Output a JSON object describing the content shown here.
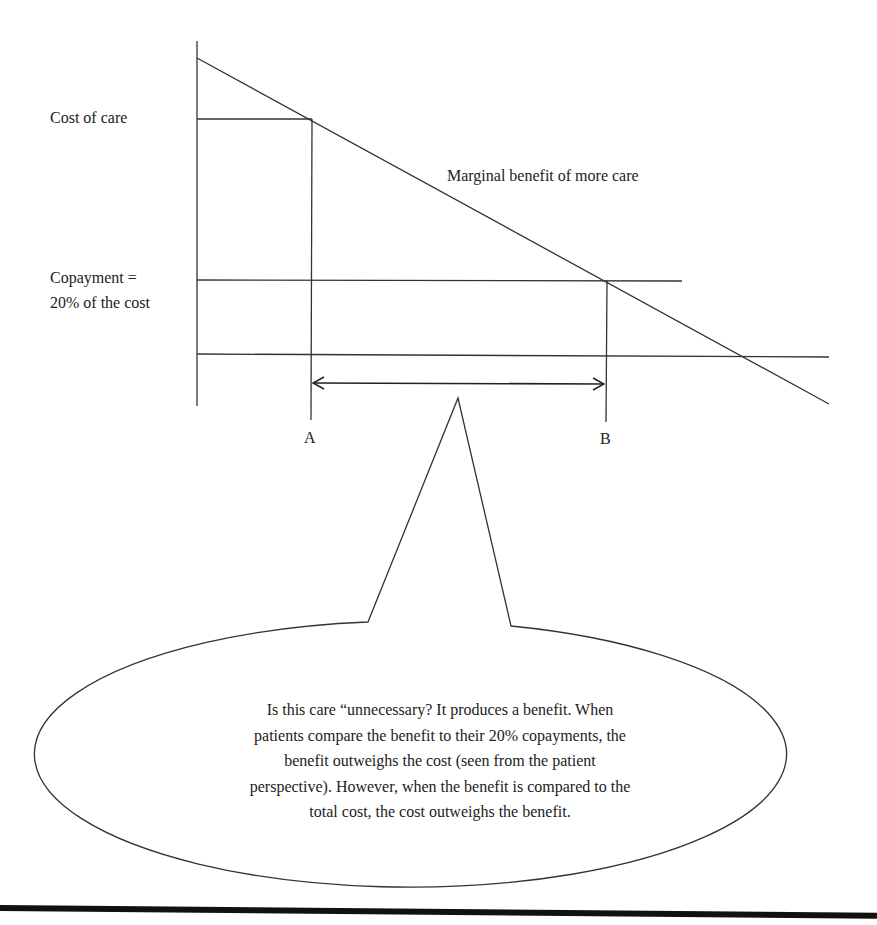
{
  "diagram": {
    "type": "economics-marginal-benefit",
    "labels": {
      "cost_of_care": "Cost of care",
      "copayment_line1": "Copayment =",
      "copayment_line2": "20% of the cost",
      "marginal_benefit": "Marginal benefit of more care",
      "point_a": "A",
      "point_b": "B"
    },
    "callout": {
      "lines": [
        "Is this care “unnecessary?  It produces a benefit. When",
        "patients compare the benefit to their 20% copayments, the",
        "benefit outweighs the cost (seen from the patient",
        "perspective). However, when the benefit is compared to the",
        "total cost, the cost outweighs the benefit."
      ]
    },
    "colors": {
      "line": "#333333",
      "text": "#222222",
      "background": "#ffffff"
    }
  }
}
